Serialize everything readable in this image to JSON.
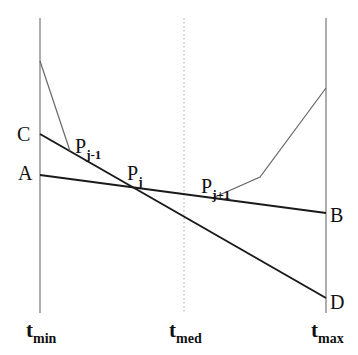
{
  "diagram": {
    "points": {
      "C": "C",
      "A": "A",
      "B": "B",
      "D": "D",
      "Pjm1": {
        "base": "P",
        "sub": "j-1"
      },
      "Pj": {
        "base": "P",
        "sub": "j"
      },
      "Pjp1": {
        "base": "P",
        "sub": "j+1"
      }
    },
    "axes": {
      "tmin": {
        "base": "t",
        "sub": "min"
      },
      "tmed": {
        "base": "t",
        "sub": "med"
      },
      "tmax": {
        "base": "t",
        "sub": "max"
      }
    },
    "colors": {
      "thick": "#1a1a1a",
      "thin": "#666666",
      "dotted": "#999999"
    }
  }
}
